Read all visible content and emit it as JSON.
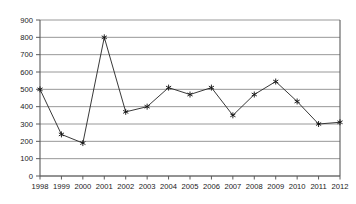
{
  "chart_data": {
    "type": "line",
    "title": "",
    "subtitle": "",
    "xlabel": "",
    "ylabel": "",
    "categories": [
      "1998",
      "1999",
      "2000",
      "2001",
      "2002",
      "2003",
      "2004",
      "2005",
      "2006",
      "2007",
      "2008",
      "2009",
      "2010",
      "2011",
      "2012"
    ],
    "values": [
      500,
      240,
      190,
      800,
      370,
      400,
      510,
      470,
      510,
      350,
      470,
      545,
      430,
      300,
      310
    ],
    "series": [
      {
        "name": "series-1",
        "values": [
          500,
          240,
          190,
          800,
          370,
          400,
          510,
          470,
          510,
          350,
          470,
          545,
          430,
          300,
          310
        ]
      }
    ],
    "ylim": [
      0,
      900
    ],
    "ytick_labels": [
      "0",
      "100",
      "200",
      "300",
      "400",
      "500",
      "600",
      "700",
      "800",
      "900"
    ],
    "ytick_values": [
      0,
      100,
      200,
      300,
      400,
      500,
      600,
      700,
      800,
      900
    ],
    "xtick_labels": [
      "1998",
      "1999",
      "2000",
      "2001",
      "2002",
      "2003",
      "2004",
      "2005",
      "2006",
      "2007",
      "2008",
      "2009",
      "2010",
      "2011",
      "2012"
    ],
    "grid": true,
    "grid_axis": "y",
    "legend": false,
    "legend_position": "none",
    "marker": "star",
    "annotations": []
  },
  "style": {
    "background": "#ffffff",
    "grid_color": "#8c8c8c",
    "axis_color": "#5a5a5a",
    "line_color": "#222222",
    "marker_color": "#111111",
    "tick_text_color": "#1a1a1a"
  },
  "geometry": {
    "plot_left": 40,
    "plot_right": 340,
    "plot_top": 20,
    "plot_bottom": 176
  }
}
